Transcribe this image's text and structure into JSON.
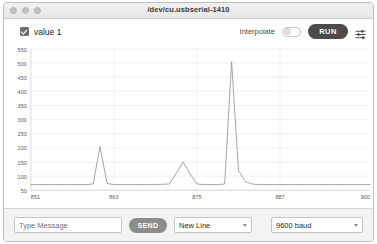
{
  "window": {
    "title": "/dev/cu.usbserial-1410",
    "traffic_lights": [
      "close",
      "minimize",
      "zoom"
    ]
  },
  "toolbar": {
    "series_label": "value 1",
    "series_checked": true,
    "interpolate_label": "Interpolate",
    "interpolate_on": false,
    "run_label": "RUN",
    "settings_icon": "sliders-icon"
  },
  "bottom": {
    "message_placeholder": "Type Message",
    "message_value": "",
    "send_label": "SEND",
    "line_ending": "New Line",
    "line_ending_options": [
      "New Line"
    ],
    "baud_rate": "9600 baud",
    "baud_options": [
      "9600 baud"
    ]
  },
  "chart_data": {
    "type": "line",
    "title": "",
    "xlabel": "",
    "ylabel": "",
    "grid": true,
    "legend": [
      "value 1"
    ],
    "legend_position": "top-left",
    "series_color": "#9a9a9a",
    "xlim": [
      851,
      900
    ],
    "ylim": [
      50,
      550
    ],
    "yticks": [
      50,
      100,
      150,
      200,
      250,
      300,
      350,
      400,
      450,
      500,
      550
    ],
    "xticks": [
      851,
      863,
      875,
      887,
      900
    ],
    "series": [
      {
        "name": "value 1",
        "x": [
          851,
          853,
          855,
          857,
          859,
          860,
          861,
          862,
          863,
          864,
          865,
          867,
          869,
          871,
          872,
          873,
          874,
          875,
          876,
          877,
          878,
          879,
          880,
          881,
          882,
          883,
          884,
          885,
          886,
          888,
          890,
          893,
          896,
          900
        ],
        "y": [
          70,
          70,
          70,
          70,
          70,
          72,
          205,
          74,
          70,
          70,
          70,
          70,
          70,
          72,
          110,
          150,
          108,
          72,
          70,
          70,
          70,
          72,
          505,
          120,
          80,
          72,
          70,
          70,
          70,
          70,
          70,
          70,
          70,
          70
        ]
      }
    ]
  }
}
